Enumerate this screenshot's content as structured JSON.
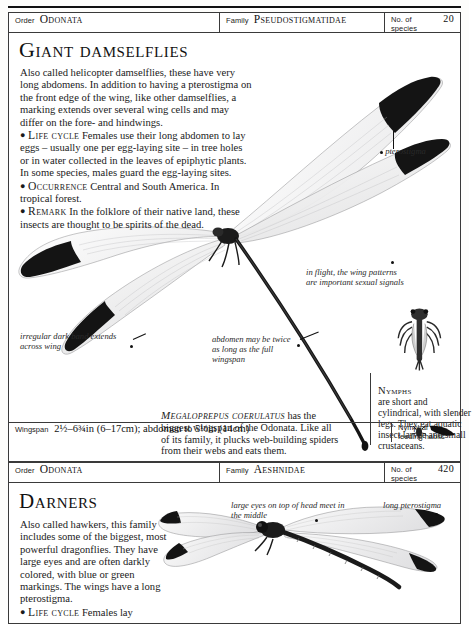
{
  "entries": [
    {
      "header": {
        "order_label": "Order",
        "order_value": "Odonata",
        "family_label": "Family",
        "family_value": "Pseudostigmatidae",
        "species_label": "No. of species",
        "species_value": "20"
      },
      "title": "Giant damselflies",
      "intro": "Also called helicopter damselflies, these have very long abdomens. In addition to having a pterostigma on the front edge of the wing, like other damselflies, a marking extends over several wing cells and may differ on the fore- and hindwings.",
      "life_cycle_head": "Life cycle",
      "life_cycle": "Females use their long abdomen to lay eggs – usually one per egg-laying site – in tree holes or in water collected in the leaves of epiphytic plants. In some species, males guard the egg-laying sites.",
      "occurrence_head": "Occurrence",
      "occurrence": "Central and South America. In tropical forest.",
      "remark_head": "Remark",
      "remark": "In the folklore of their native land, these insects are thought to be spirits of the dead.",
      "species_caption_name": "Megaloprepus coerulatus",
      "species_caption_text": "has the biggest wingspan of the Odonata. Like all of its family, it plucks web-building spiders from their webs and eats them.",
      "nymph_head": "Nymphs",
      "nymph_text": "are short and cylindrical, with slender legs. They eat aquatic insect larvae and small crustaceans.",
      "annotations": [
        "pterostigma",
        "in flight, the wing patterns are important sexual signals",
        "irregular dark band extends across wing",
        "abdomen may be twice as long as the full wingspan"
      ],
      "footer": {
        "wingspan_label": "Wingspan",
        "wingspan_value": "2½–6¾in (6–17cm); abdomen to 5½in (14cm)",
        "nymphal_label": "Nymphal feeding habits"
      }
    },
    {
      "header": {
        "order_label": "Order",
        "order_value": "Odonata",
        "family_label": "Family",
        "family_value": "Aeshnidae",
        "species_label": "No. of species",
        "species_value": "420"
      },
      "title": "Darners",
      "intro": "Also called hawkers, this family includes some of the biggest, most powerful dragonflies. They have large eyes and are often darkly colored, with blue or green markings. The wings have a long pterostigma.",
      "life_cycle_head": "Life cycle",
      "life_cycle": "Females lay",
      "annotations": [
        "large eyes on top of head meet in the middle",
        "long pterostigma"
      ]
    }
  ],
  "colors": {
    "ink": "#1a1a1a",
    "rule": "#3a3a3a",
    "paper": "#fdfdfb",
    "wing_dark": "#111111"
  }
}
